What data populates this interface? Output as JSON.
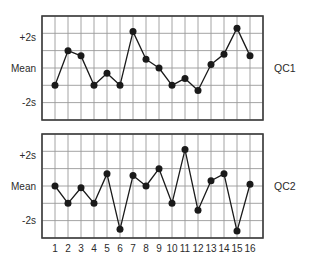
{
  "figure": {
    "type": "levey-jennings-control-chart",
    "background_color": "#ffffff",
    "line_color": "#1a1a1a",
    "marker_color": "#1a1a1a",
    "grid_color": "#9a9a9a",
    "frame_color": "#3c3c3c"
  },
  "charts": [
    {
      "id": "qc1",
      "panel_label": "QC1",
      "y_tick_labels": [
        "+2s",
        "Mean",
        "-2s"
      ]
    },
    {
      "id": "qc2",
      "panel_label": "QC2",
      "y_tick_labels": [
        "+2s",
        "Mean",
        "-2s"
      ]
    }
  ],
  "x_tick_labels": [
    "1",
    "2",
    "3",
    "4",
    "5",
    "6",
    "7",
    "8",
    "9",
    "10",
    "11",
    "12",
    "13",
    "14",
    "15",
    "16"
  ],
  "chart_data": [
    {
      "type": "line",
      "title": "QC1",
      "xlabel": "",
      "ylabel": "",
      "x": [
        1,
        2,
        3,
        4,
        5,
        6,
        7,
        8,
        9,
        10,
        11,
        12,
        13,
        14,
        15,
        16
      ],
      "x_ticklabels": [
        "1",
        "2",
        "3",
        "4",
        "5",
        "6",
        "7",
        "8",
        "9",
        "10",
        "11",
        "12",
        "13",
        "14",
        "15",
        "16"
      ],
      "values": [
        -1.0,
        1.0,
        0.7,
        -1.0,
        -0.3,
        -1.0,
        2.1,
        0.5,
        0.0,
        -1.0,
        -0.6,
        -1.3,
        0.2,
        0.8,
        2.3,
        0.7
      ],
      "ylim": [
        -3.0,
        3.0
      ],
      "ytick_values": [
        2,
        0,
        -2
      ],
      "ytick_labels": [
        "+2s",
        "Mean",
        "-2s"
      ],
      "grid": true,
      "legend": "none",
      "marker": "filled-circle",
      "series_label": "QC1"
    },
    {
      "type": "line",
      "title": "QC2",
      "xlabel": "",
      "ylabel": "",
      "x": [
        1,
        2,
        3,
        4,
        5,
        6,
        7,
        8,
        9,
        10,
        11,
        12,
        13,
        14,
        15,
        16
      ],
      "x_ticklabels": [
        "1",
        "2",
        "3",
        "4",
        "5",
        "6",
        "7",
        "8",
        "9",
        "10",
        "11",
        "12",
        "13",
        "14",
        "15",
        "16"
      ],
      "values": [
        0.0,
        -1.0,
        -0.1,
        -1.0,
        0.7,
        -2.5,
        0.6,
        0.0,
        1.0,
        -1.0,
        2.1,
        -1.4,
        0.3,
        0.7,
        -2.6,
        0.1
      ],
      "ylim": [
        -3.0,
        3.0
      ],
      "ytick_values": [
        2,
        0,
        -2
      ],
      "ytick_labels": [
        "+2s",
        "Mean",
        "-2s"
      ],
      "grid": true,
      "legend": "none",
      "marker": "filled-circle",
      "series_label": "QC2"
    }
  ]
}
